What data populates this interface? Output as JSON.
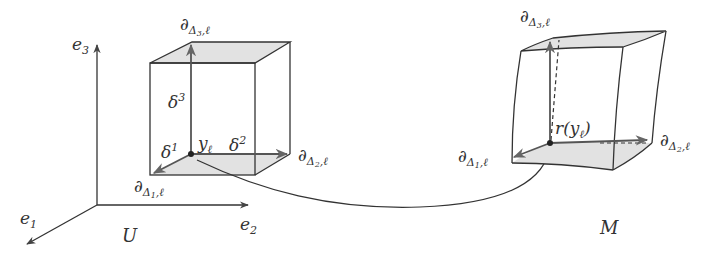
{
  "figure": {
    "left_space_label": "U",
    "right_space_label": "M",
    "axes": {
      "e1": {
        "base": "e",
        "sub": "1"
      },
      "e2": {
        "base": "e",
        "sub": "2"
      },
      "e3": {
        "base": "e",
        "sub": "3"
      }
    },
    "left_cube": {
      "point_label": {
        "base": "y",
        "sub": "ℓ"
      },
      "delta1": {
        "base": "δ",
        "sup": "1"
      },
      "delta2": {
        "base": "δ",
        "sup": "2"
      },
      "delta3": {
        "base": "δ",
        "sup": "3"
      },
      "d1": {
        "base": "∂",
        "sub": "Δ",
        "subsub": "1",
        "tail": ",ℓ"
      },
      "d2": {
        "base": "∂",
        "sub": "Δ",
        "subsub": "2",
        "tail": ",ℓ"
      },
      "d3": {
        "base": "∂",
        "sub": "Δ",
        "subsub": "3",
        "tail": ",ℓ"
      }
    },
    "right_box": {
      "point_label": {
        "pre": "r(",
        "base": "y",
        "sub": "ℓ",
        "post": ")"
      },
      "d1": {
        "base": "∂",
        "sub": "Δ",
        "subsub": "1",
        "tail": ",ℓ"
      },
      "d2": {
        "base": "∂",
        "sub": "Δ",
        "subsub": "2",
        "tail": ",ℓ"
      },
      "d3": {
        "base": "∂",
        "sub": "Δ",
        "subsub": "3",
        "tail": ",ℓ"
      }
    },
    "colors": {
      "line": "#333333",
      "arrow": "#555555",
      "face_fill": "#e2e2e2"
    }
  }
}
